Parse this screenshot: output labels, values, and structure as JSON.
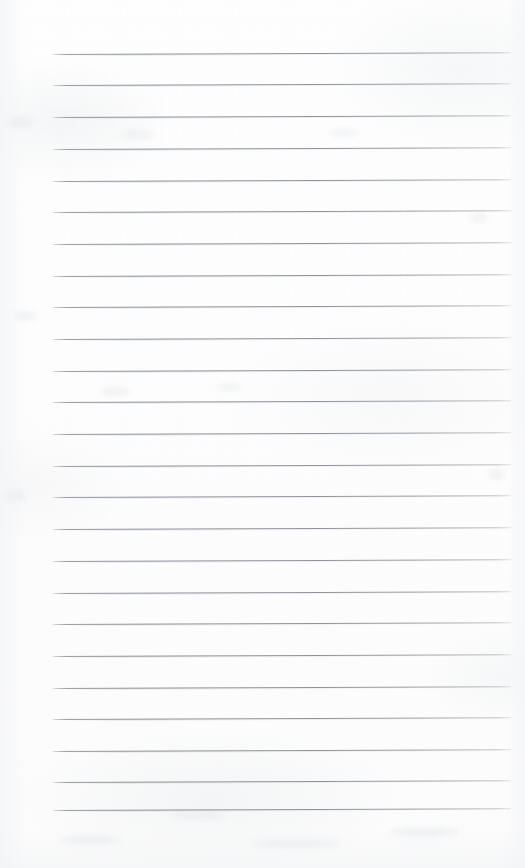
{
  "page": {
    "kind": "lined-notepad-page",
    "width": 525,
    "height": 868,
    "content_text": "",
    "background_color": "#fdfdfd",
    "rule_color": "#7c8086"
  },
  "ruling": {
    "line_count": 25,
    "first_line_y": 54,
    "line_spacing": 31.5,
    "line_left_x": 53,
    "line_right_x": 511,
    "line_thickness": 1,
    "tilt_degrees": -0.22,
    "left_margin_width": 53,
    "right_margin_width": 14,
    "top_margin_height": 54,
    "bottom_margin_height": 58,
    "has_vertical_margin_rule": false
  },
  "lines": [
    {
      "index": 1,
      "y": 54,
      "text": ""
    },
    {
      "index": 2,
      "y": 85,
      "text": ""
    },
    {
      "index": 3,
      "y": 117,
      "text": ""
    },
    {
      "index": 4,
      "y": 149,
      "text": ""
    },
    {
      "index": 5,
      "y": 181,
      "text": ""
    },
    {
      "index": 6,
      "y": 212,
      "text": ""
    },
    {
      "index": 7,
      "y": 244,
      "text": ""
    },
    {
      "index": 8,
      "y": 276,
      "text": ""
    },
    {
      "index": 9,
      "y": 307,
      "text": ""
    },
    {
      "index": 10,
      "y": 339,
      "text": ""
    },
    {
      "index": 11,
      "y": 371,
      "text": ""
    },
    {
      "index": 12,
      "y": 402,
      "text": ""
    },
    {
      "index": 13,
      "y": 434,
      "text": ""
    },
    {
      "index": 14,
      "y": 466,
      "text": ""
    },
    {
      "index": 15,
      "y": 497,
      "text": ""
    },
    {
      "index": 16,
      "y": 529,
      "text": ""
    },
    {
      "index": 17,
      "y": 561,
      "text": ""
    },
    {
      "index": 18,
      "y": 593,
      "text": ""
    },
    {
      "index": 19,
      "y": 624,
      "text": ""
    },
    {
      "index": 20,
      "y": 656,
      "text": ""
    },
    {
      "index": 21,
      "y": 688,
      "text": ""
    },
    {
      "index": 22,
      "y": 719,
      "text": ""
    },
    {
      "index": 23,
      "y": 751,
      "text": ""
    },
    {
      "index": 24,
      "y": 782,
      "text": ""
    },
    {
      "index": 25,
      "y": 810,
      "text": ""
    }
  ],
  "smudges": [
    {
      "x": 8,
      "y": 118,
      "w": 26,
      "h": 9
    },
    {
      "x": 14,
      "y": 312,
      "w": 22,
      "h": 8
    },
    {
      "x": 120,
      "y": 131,
      "w": 34,
      "h": 7
    },
    {
      "x": 330,
      "y": 130,
      "w": 28,
      "h": 6
    },
    {
      "x": 100,
      "y": 388,
      "w": 30,
      "h": 7
    },
    {
      "x": 218,
      "y": 384,
      "w": 24,
      "h": 6
    },
    {
      "x": 6,
      "y": 492,
      "w": 20,
      "h": 8
    },
    {
      "x": 470,
      "y": 214,
      "w": 18,
      "h": 7
    },
    {
      "x": 488,
      "y": 470,
      "w": 16,
      "h": 9
    },
    {
      "x": 60,
      "y": 836,
      "w": 60,
      "h": 8
    },
    {
      "x": 250,
      "y": 840,
      "w": 90,
      "h": 7
    },
    {
      "x": 390,
      "y": 828,
      "w": 70,
      "h": 8
    },
    {
      "x": 170,
      "y": 812,
      "w": 54,
      "h": 6
    }
  ]
}
